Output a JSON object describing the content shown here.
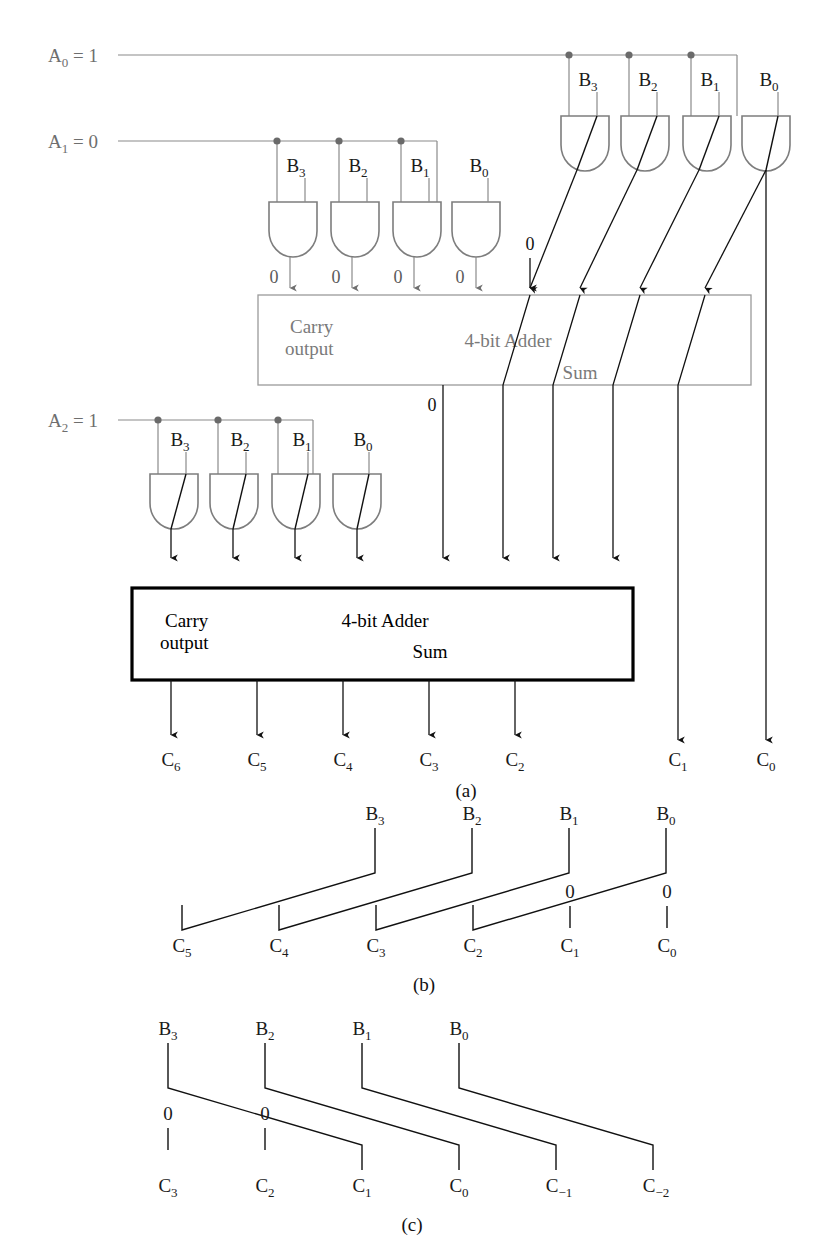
{
  "figure": {
    "captions": {
      "a": "(a)",
      "b": "(b)",
      "c": "(c)"
    }
  },
  "panel_a": {
    "inputs": [
      {
        "name": "A0",
        "label": "A",
        "sub": "0",
        "eq": "= 1",
        "full": "A₀ = 1"
      },
      {
        "name": "A1",
        "label": "A",
        "sub": "1",
        "eq": "= 0",
        "full": "A₁ = 0"
      },
      {
        "name": "A2",
        "label": "A",
        "sub": "2",
        "eq": "= 1",
        "full": "A₂ = 1"
      }
    ],
    "gate_rows": [
      {
        "row": "A0-row",
        "active": true,
        "b_labels": [
          "B",
          "B",
          "B",
          "B"
        ],
        "b_subs": [
          "3",
          "2",
          "1",
          "0"
        ],
        "output_labels": [
          "",
          "",
          "",
          ""
        ]
      },
      {
        "row": "A1-row",
        "active": false,
        "b_labels": [
          "B",
          "B",
          "B",
          "B"
        ],
        "b_subs": [
          "3",
          "2",
          "1",
          "0"
        ],
        "output_labels": [
          "0",
          "0",
          "0",
          "0"
        ]
      },
      {
        "row": "A2-row",
        "active": true,
        "b_labels": [
          "B",
          "B",
          "B",
          "B"
        ],
        "b_subs": [
          "3",
          "2",
          "1",
          "0"
        ],
        "output_labels": [
          "",
          "",
          "",
          ""
        ]
      }
    ],
    "adders": [
      {
        "name": "top-adder",
        "style": "gray",
        "carry_line1": "Carry",
        "carry_line2": "output",
        "title": "4-bit Adder",
        "sum": "Sum",
        "carry_in": "0"
      },
      {
        "name": "bottom-adder",
        "style": "black",
        "carry_line1": "Carry",
        "carry_line2": "output",
        "title": "4-bit Adder",
        "sum": "Sum",
        "carry_in": "0"
      }
    ],
    "outputs": [
      {
        "label": "C",
        "sub": "6"
      },
      {
        "label": "C",
        "sub": "5"
      },
      {
        "label": "C",
        "sub": "4"
      },
      {
        "label": "C",
        "sub": "3"
      },
      {
        "label": "C",
        "sub": "2"
      },
      {
        "label": "C",
        "sub": "1"
      },
      {
        "label": "C",
        "sub": "0"
      }
    ]
  },
  "panel_b": {
    "top_labels": [
      {
        "label": "B",
        "sub": "3"
      },
      {
        "label": "B",
        "sub": "2"
      },
      {
        "label": "B",
        "sub": "1"
      },
      {
        "label": "B",
        "sub": "0"
      }
    ],
    "constants": [
      "0",
      "0"
    ],
    "bottom_labels": [
      {
        "label": "C",
        "sub": "5"
      },
      {
        "label": "C",
        "sub": "4"
      },
      {
        "label": "C",
        "sub": "3"
      },
      {
        "label": "C",
        "sub": "2"
      },
      {
        "label": "C",
        "sub": "1"
      },
      {
        "label": "C",
        "sub": "0"
      }
    ],
    "mapping": [
      "B3→C5",
      "B2→C4",
      "B1→C3",
      "B0→C2",
      "0→C1",
      "0→C0"
    ]
  },
  "panel_c": {
    "top_labels": [
      {
        "label": "B",
        "sub": "3"
      },
      {
        "label": "B",
        "sub": "2"
      },
      {
        "label": "B",
        "sub": "1"
      },
      {
        "label": "B",
        "sub": "0"
      }
    ],
    "constants": [
      "0",
      "0"
    ],
    "bottom_labels": [
      {
        "label": "C",
        "sub": "3"
      },
      {
        "label": "C",
        "sub": "2"
      },
      {
        "label": "C",
        "sub": "1"
      },
      {
        "label": "C",
        "sub": "0"
      },
      {
        "label": "C",
        "sub": "−1"
      },
      {
        "label": "C",
        "sub": "−2"
      }
    ],
    "mapping": [
      "0→C3",
      "0→C2",
      "B3→C1",
      "B2→C0",
      "B1→C−1",
      "B0→C−2"
    ]
  },
  "colors": {
    "gray_wire": "#8a8a8a",
    "dark_wire": "#111111",
    "gate_gray": "#7d7d7d",
    "box_black": "#000000",
    "background": "#ffffff"
  }
}
